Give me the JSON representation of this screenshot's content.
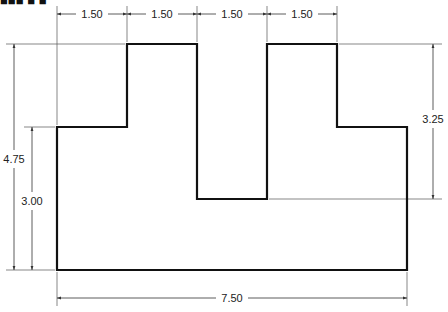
{
  "title_fragment": "■■■ ■ ■",
  "drawing": {
    "stroke_color": "#111111",
    "dim_color": "#333333",
    "outline_points": [
      [
        57,
        270
      ],
      [
        57,
        127
      ],
      [
        127,
        127
      ],
      [
        127,
        44
      ],
      [
        197,
        44
      ],
      [
        197,
        199
      ],
      [
        267,
        199
      ],
      [
        267,
        44
      ],
      [
        337,
        44
      ],
      [
        337,
        127
      ],
      [
        407,
        127
      ],
      [
        407,
        270
      ]
    ],
    "dimensions": {
      "top": [
        {
          "label": "1.50",
          "x1": 57,
          "x2": 127
        },
        {
          "label": "1.50",
          "x1": 127,
          "x2": 197
        },
        {
          "label": "1.50",
          "x1": 197,
          "x2": 267
        },
        {
          "label": "1.50",
          "x1": 267,
          "x2": 337
        }
      ],
      "overall_height": {
        "label": "4.75"
      },
      "step_height": {
        "label": "3.00"
      },
      "notch_depth": {
        "label": "3.25"
      },
      "overall_width": {
        "label": "7.50"
      }
    }
  }
}
